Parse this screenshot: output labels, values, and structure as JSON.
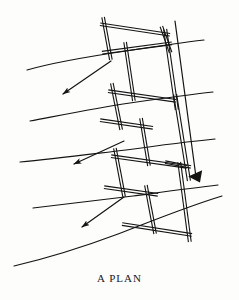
{
  "figure": {
    "caption": "A PLAN",
    "background_color": "#fdfdfc",
    "ink_color": "#141414",
    "width": 239,
    "height": 300
  },
  "drawing": {
    "type": "architectural-site-plan",
    "description": "Zigzag stepped building footprint in double-line wall convention overlaid on sloping site contour lines",
    "wall_convention": "double-line",
    "wall_stroke_width": 1.1,
    "contour_stroke_width": 1.15,
    "arrow_stroke_width": 1.2,
    "contours": [
      {
        "name": "contour-1",
        "path": "M 27,70 C 55,62 92,56 126,51 C 152,47 178,43 204,40"
      },
      {
        "name": "contour-2",
        "path": "M 30,121 C 62,115 97,108 130,103 C 158,99 186,95 213,92"
      },
      {
        "name": "contour-3",
        "path": "M 20,162 C 54,159 92,154 126,150 C 155,146 185,142 215,139"
      },
      {
        "name": "contour-4",
        "path": "M 33,208 C 66,204 100,200 133,196 C 163,192 192,188 218,185"
      },
      {
        "name": "contour-5",
        "path": "M 14,266 C 48,258 86,246 118,234 C 152,221 186,207 222,196"
      }
    ],
    "slope_arrows": [
      {
        "name": "slope-arrow-1",
        "from_x": 111,
        "from_y": 61,
        "to_x": 63,
        "to_y": 94
      },
      {
        "name": "slope-arrow-2",
        "from_x": 124,
        "from_y": 141,
        "to_x": 74,
        "to_y": 164
      },
      {
        "name": "slope-arrow-3",
        "from_x": 124,
        "from_y": 197,
        "to_x": 82,
        "to_y": 227
      }
    ],
    "direction_arrow": {
      "name": "long-direction-arrow",
      "from_x": 175,
      "from_y": 21,
      "to_x": 196,
      "to_y": 177
    },
    "walls": [
      {
        "name": "wall-top-upper",
        "x1": 105,
        "y1": 25,
        "x2": 165,
        "y2": 34,
        "gap": 2.6,
        "ext": 5
      },
      {
        "name": "wall-top-left",
        "x1": 104,
        "y1": 22,
        "x2": 110,
        "y2": 55,
        "gap": 2.6,
        "ext": 5
      },
      {
        "name": "wall-top-lower",
        "x1": 107,
        "y1": 52,
        "x2": 167,
        "y2": 44,
        "gap": 2.6,
        "ext": 5
      },
      {
        "name": "wall-top-right",
        "x1": 163,
        "y1": 31,
        "x2": 169,
        "y2": 48,
        "gap": 2.6,
        "ext": 5
      },
      {
        "name": "wall-spine-right-upper",
        "x1": 166,
        "y1": 35,
        "x2": 176,
        "y2": 104,
        "gap": 3.0,
        "ext": 6
      },
      {
        "name": "wall-spine-right-lower",
        "x1": 176,
        "y1": 100,
        "x2": 188,
        "y2": 175,
        "gap": 3.0,
        "ext": 6
      },
      {
        "name": "wall-step1-vert",
        "x1": 126,
        "y1": 48,
        "x2": 133,
        "y2": 95,
        "gap": 2.6,
        "ext": 6
      },
      {
        "name": "wall-step1-horz",
        "x1": 114,
        "y1": 92,
        "x2": 170,
        "y2": 100,
        "gap": 2.6,
        "ext": 6
      },
      {
        "name": "wall-mid-left",
        "x1": 113,
        "y1": 89,
        "x2": 120,
        "y2": 124,
        "gap": 2.6,
        "ext": 6
      },
      {
        "name": "wall-mid-horz",
        "x1": 106,
        "y1": 121,
        "x2": 147,
        "y2": 127,
        "gap": 2.6,
        "ext": 6
      },
      {
        "name": "wall-step2-vert",
        "x1": 142,
        "y1": 124,
        "x2": 148,
        "y2": 160,
        "gap": 2.6,
        "ext": 6
      },
      {
        "name": "wall-step2-horz",
        "x1": 117,
        "y1": 157,
        "x2": 181,
        "y2": 166,
        "gap": 2.6,
        "ext": 6
      },
      {
        "name": "wall-low-left",
        "x1": 116,
        "y1": 154,
        "x2": 123,
        "y2": 191,
        "gap": 2.6,
        "ext": 6
      },
      {
        "name": "wall-low-horz",
        "x1": 110,
        "y1": 188,
        "x2": 152,
        "y2": 194,
        "gap": 2.6,
        "ext": 6
      },
      {
        "name": "wall-step3-vert",
        "x1": 147,
        "y1": 191,
        "x2": 154,
        "y2": 228,
        "gap": 2.6,
        "ext": 6
      },
      {
        "name": "wall-bottom-horz",
        "x1": 128,
        "y1": 225,
        "x2": 186,
        "y2": 234,
        "gap": 2.6,
        "ext": 6
      },
      {
        "name": "wall-bottom-right-vert",
        "x1": 180,
        "y1": 168,
        "x2": 189,
        "y2": 236,
        "gap": 2.8,
        "ext": 6
      },
      {
        "name": "wall-mid-right-stub",
        "x1": 170,
        "y1": 163,
        "x2": 186,
        "y2": 166,
        "gap": 2.4,
        "ext": 5
      }
    ]
  }
}
